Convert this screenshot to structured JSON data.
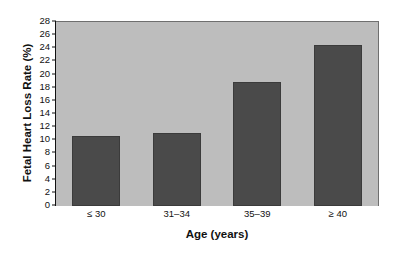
{
  "chart_data": {
    "type": "bar",
    "title": "",
    "categories": [
      "≤ 30",
      "31–34",
      "35–39",
      "≥ 40"
    ],
    "values": [
      10.6,
      11.1,
      18.9,
      24.5
    ],
    "xlabel": "Age (years)",
    "ylabel": "Fetal Heart Loss Rate (%)",
    "ylim": [
      0,
      28
    ],
    "ytick_step": 2,
    "yticks": [
      "0",
      "2",
      "4",
      "6",
      "8",
      "10",
      "12",
      "14",
      "16",
      "18",
      "20",
      "22",
      "24",
      "26",
      "28"
    ],
    "grid": false,
    "legend": null,
    "bar_color": "#4a4a4a",
    "plot_background": "#bdbdbd",
    "page_background": "#ffffff",
    "axis_color": "#111111"
  }
}
